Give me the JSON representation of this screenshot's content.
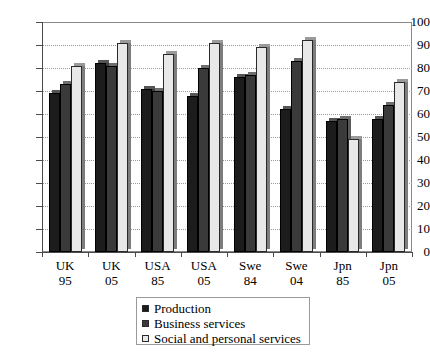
{
  "chart_data": {
    "type": "bar",
    "title": "",
    "subtitle": "",
    "xlabel": "",
    "ylabel": "",
    "ylim": [
      0,
      100
    ],
    "ytick_step": 10,
    "yticks": [
      0,
      10,
      20,
      30,
      40,
      50,
      60,
      70,
      80,
      90,
      100
    ],
    "grid": true,
    "grid_style": "dotted-horizontal",
    "legend_position": "bottom-center",
    "categories": [
      "UK 95",
      "UK 05",
      "USA 85",
      "USA 05",
      "Swe 84",
      "Swe 04",
      "Jpn 85",
      "Jpn 05"
    ],
    "category_lines": [
      {
        "l1": "UK",
        "l2": "95"
      },
      {
        "l1": "UK",
        "l2": "05"
      },
      {
        "l1": "USA",
        "l2": "85"
      },
      {
        "l1": "USA",
        "l2": "05"
      },
      {
        "l1": "Swe",
        "l2": "84"
      },
      {
        "l1": "Swe",
        "l2": "04"
      },
      {
        "l1": "Jpn",
        "l2": "85"
      },
      {
        "l1": "Jpn",
        "l2": "05"
      }
    ],
    "series": [
      {
        "name": "Production",
        "color": "#1c1c1c",
        "values": [
          69,
          82,
          71,
          68,
          76,
          62,
          57,
          58
        ]
      },
      {
        "name": "Business services",
        "color": "#3a3a3a",
        "values": [
          73,
          81,
          70,
          80,
          77,
          83,
          58,
          64
        ]
      },
      {
        "name": "Social and personal services",
        "color": "#e8e8e8",
        "values": [
          81,
          91,
          86,
          91,
          89,
          92,
          49,
          74
        ]
      }
    ]
  },
  "legend": {
    "items": [
      {
        "label": "Production"
      },
      {
        "label": "Business services"
      },
      {
        "label": "Social and personal services"
      }
    ]
  }
}
